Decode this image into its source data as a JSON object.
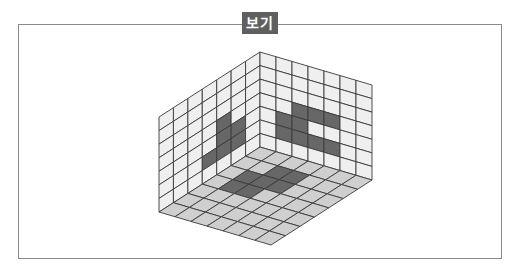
{
  "label": "보기",
  "colors": {
    "frame": "#8a8a8a",
    "label_bg": "#5f5f5f",
    "wall_cell": "#efefef",
    "floor_cell": "#cfcfcf",
    "shaded_cell": "#676767",
    "grid_line": "#3a3a3a"
  },
  "cube": {
    "grid_size": 7,
    "description": "Interior view of a 7x7x7 box showing left wall, back/right wall and floor with shaded cells",
    "geometry": {
      "inner_corner": [
        260,
        147
      ],
      "top_vertex": [
        260,
        52
      ],
      "left_top": [
        159,
        117
      ],
      "right_top": [
        372,
        85
      ],
      "left_bottom": [
        159,
        212
      ],
      "right_bottom": [
        372,
        180
      ],
      "bottom_vertex": [
        272,
        244
      ]
    },
    "left_wall_shaded": [
      [
        3,
        5
      ],
      [
        4,
        3
      ],
      [
        4,
        4
      ],
      [
        4,
        5
      ],
      [
        5,
        4
      ],
      [
        5,
        5
      ]
    ],
    "right_wall_shaded": [
      [
        1,
        4
      ],
      [
        1,
        5
      ],
      [
        2,
        3
      ],
      [
        2,
        4
      ],
      [
        2,
        5
      ],
      [
        3,
        3
      ],
      [
        3,
        5
      ],
      [
        4,
        3
      ],
      [
        4,
        5
      ]
    ],
    "floor_shaded": [
      [
        2,
        1
      ],
      [
        3,
        1
      ],
      [
        1,
        2
      ],
      [
        2,
        2
      ],
      [
        3,
        2
      ],
      [
        1,
        3
      ],
      [
        2,
        3
      ]
    ]
  }
}
